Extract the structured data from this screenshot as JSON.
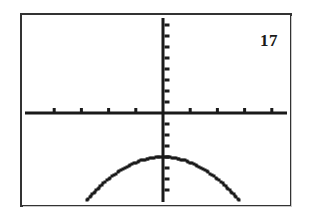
{
  "problem": {
    "number": "17"
  },
  "screen": {
    "label": "graphing-calculator-screen",
    "frame_color": "#333333",
    "background_color": "#ffffff",
    "ink_color": "#1a1a1a"
  },
  "chart_data": {
    "type": "line",
    "title": "",
    "subtitle": "",
    "xlabel": "",
    "ylabel": "",
    "grid": false,
    "legend_position": "none",
    "axes": {
      "x_axis_visible": true,
      "y_axis_visible": true,
      "x_axis_screen_y": 113,
      "y_axis_screen_x": 163,
      "xlim": [
        -10,
        10
      ],
      "ylim": [
        -10,
        10
      ],
      "x_tick_interval": 1,
      "y_tick_interval": 1,
      "x_tick_count": 10,
      "y_tick_count": 20,
      "tick_labels_shown": false
    },
    "annotations": [
      {
        "text": "17",
        "position": "top-right",
        "role": "problem-number"
      }
    ],
    "series": [
      {
        "name": "downward parabola",
        "style": "pixel-dotted",
        "vertex": [
          0,
          -4
        ],
        "opens": "down",
        "x": [
          -3.2,
          -3.0,
          -2.8,
          -2.6,
          -2.4,
          -2.2,
          -2.0,
          -1.8,
          -1.6,
          -1.4,
          -1.2,
          -1.0,
          -0.8,
          -0.6,
          -0.4,
          -0.2,
          0.0,
          0.2,
          0.4,
          0.6,
          0.8,
          1.0,
          1.2,
          1.4,
          1.6,
          1.8,
          2.0,
          2.2,
          2.4,
          2.6,
          2.8,
          3.0,
          3.2
        ],
        "values": [
          -9.1,
          -8.5,
          -7.9,
          -7.4,
          -6.9,
          -6.4,
          -6.0,
          -5.6,
          -5.3,
          -5.0,
          -4.7,
          -4.5,
          -4.3,
          -4.2,
          -4.1,
          -4.0,
          -4.0,
          -4.0,
          -4.1,
          -4.2,
          -4.3,
          -4.5,
          -4.7,
          -5.0,
          -5.3,
          -5.6,
          -6.0,
          -6.4,
          -6.9,
          -7.4,
          -7.9,
          -8.5,
          -9.1
        ]
      }
    ]
  }
}
